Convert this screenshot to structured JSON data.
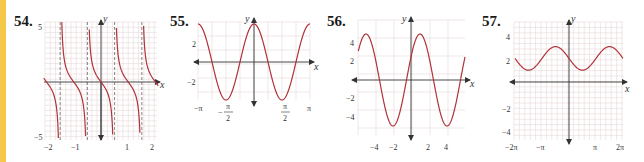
{
  "colors": {
    "accent_stripe": "#f5c84a",
    "curve": "#b0323a",
    "grid": "#e6d6d8",
    "axis": "#333333",
    "asymptote": "#555555"
  },
  "problems": [
    {
      "number": "54.",
      "axis_labels": {
        "x": "x",
        "y": "y"
      }
    },
    {
      "number": "55.",
      "axis_labels": {
        "x": "x",
        "y": "y"
      }
    },
    {
      "number": "56.",
      "axis_labels": {
        "x": "x",
        "y": "y"
      }
    },
    {
      "number": "57.",
      "axis_labels": {
        "x": "x",
        "y": "y"
      }
    }
  ],
  "chart_data": [
    {
      "id": "54",
      "type": "line",
      "title": "54.",
      "function_shape": "y = -tan(3x) (decreasing tangent branches)",
      "xlabel": "x",
      "ylabel": "y",
      "xlim": [
        -2.2,
        2.2
      ],
      "ylim": [
        -5,
        5
      ],
      "x_ticks": [
        "-2",
        "-1",
        "1",
        "2"
      ],
      "y_ticks": [
        "5",
        "-5"
      ],
      "asymptotes_x": [
        -1.571,
        -0.524,
        0.524,
        1.571
      ],
      "grid": true
    },
    {
      "id": "55",
      "type": "line",
      "title": "55.",
      "function_shape": "y = 4cos(2x)",
      "xlabel": "x",
      "ylabel": "y",
      "xlim": [
        -3.1416,
        3.1416
      ],
      "ylim": [
        -4,
        4
      ],
      "x_ticks": [
        "-π",
        "-π/2",
        "π/2",
        "π"
      ],
      "y_ticks": [
        "2",
        "-2"
      ],
      "points": [
        [
          -3.1416,
          4
        ],
        [
          -1.5708,
          -4
        ],
        [
          0,
          4
        ],
        [
          1.5708,
          -4
        ],
        [
          3.1416,
          4
        ]
      ],
      "grid": true
    },
    {
      "id": "56",
      "type": "line",
      "title": "56.",
      "function_shape": "y = 5 sin(π(x+0.5)/3)",
      "xlabel": "x",
      "ylabel": "y",
      "xlim": [
        -6,
        6
      ],
      "ylim": [
        -6,
        6
      ],
      "x_ticks": [
        "-4",
        "-2",
        "2",
        "4"
      ],
      "y_ticks": [
        "4",
        "2",
        "-2",
        "-4"
      ],
      "points": [
        [
          -5,
          5
        ],
        [
          -2,
          -5
        ],
        [
          1,
          5
        ],
        [
          4,
          -5
        ]
      ],
      "grid": true
    },
    {
      "id": "57",
      "type": "line",
      "title": "57.",
      "function_shape": "y = 2 - sin(x)",
      "xlabel": "x",
      "ylabel": "y",
      "xlim": [
        -6.2832,
        6.2832
      ],
      "ylim": [
        -5,
        5
      ],
      "x_ticks": [
        "-2π",
        "-π",
        "π",
        "2π"
      ],
      "y_ticks": [
        "4",
        "2",
        "-2",
        "-4"
      ],
      "points": [
        [
          -6.2832,
          2
        ],
        [
          -4.7124,
          1
        ],
        [
          -1.5708,
          3
        ],
        [
          1.5708,
          1
        ],
        [
          4.7124,
          3
        ],
        [
          6.2832,
          2
        ]
      ],
      "grid": true
    }
  ],
  "tick_labels": {
    "g54": {
      "y5": "5",
      "yn5": "−5",
      "xn2": "−2",
      "xn1": "−1",
      "x1": "1",
      "x2": "2"
    },
    "g55": {
      "y2": "2",
      "yn2": "−2",
      "xnpi": "−π",
      "xnpi2_num": "π",
      "xnpi2_den": "2",
      "xnpi2_sign": "−",
      "xpi2_num": "π",
      "xpi2_den": "2",
      "xpi": "π"
    },
    "g56": {
      "y4": "4",
      "y2": "2",
      "yn2": "−2",
      "yn4": "−4",
      "xn4": "−4",
      "xn2": "−2",
      "x2": "2",
      "x4": "4"
    },
    "g57": {
      "y4": "4",
      "y2": "2",
      "yn2": "−2",
      "yn4": "−4",
      "xn2pi": "−2π",
      "xnpi": "−π",
      "xpi": "π",
      "x2pi": "2π"
    }
  }
}
